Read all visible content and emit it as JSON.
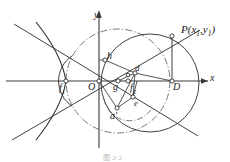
{
  "figure": {
    "kind": "geometry-diagram",
    "width": 230,
    "height": 162,
    "background_color": "#ffffff",
    "stroke_color": "#2b2b2b",
    "axis_color": "#3a3a3a",
    "dashdot_color": "#4a4a4a",
    "caption": "图 2-2"
  },
  "axes": {
    "x_label": "x",
    "y_label": "y",
    "origin_label": "O"
  },
  "points": [
    {
      "id": "f1",
      "label": "f",
      "sub": "1",
      "x": 62,
      "y": 81
    },
    {
      "id": "origin",
      "label": "O",
      "sub": "",
      "x": 99,
      "y": 81
    },
    {
      "id": "g",
      "label": "g",
      "sub": "",
      "x": 118,
      "y": 81
    },
    {
      "id": "f2",
      "label": "f",
      "sub": "2",
      "x": 136,
      "y": 81
    },
    {
      "id": "D",
      "label": "D",
      "sub": "",
      "x": 172,
      "y": 81
    },
    {
      "id": "h",
      "label": "h",
      "sub": "",
      "x": 105,
      "y": 58
    },
    {
      "id": "d",
      "label": "d",
      "sub": "",
      "x": 135,
      "y": 72
    },
    {
      "id": "e",
      "label": "e",
      "sub": "",
      "x": 133,
      "y": 98
    },
    {
      "id": "aprime",
      "label": "a",
      "sub": "",
      "x": 117,
      "y": 110
    },
    {
      "id": "P",
      "label": "P",
      "sub": "",
      "x": 172,
      "y": 36
    }
  ],
  "labels": {
    "y_axis": "y",
    "x_axis": "x",
    "origin": "O",
    "f1": "f",
    "f1_sub": "1",
    "f2": "f",
    "f2_sub": "2",
    "g": "g",
    "h": "h",
    "d": "d",
    "e": "e",
    "a_prime": "a′",
    "D": "D",
    "P_main": "P(x",
    "P_sub1": "1",
    "P_mid": ",y",
    "P_sub2": "1",
    "P_end": ")"
  },
  "curves": {
    "hyperbola_left_branch": "left branch of hyperbola passing near f1",
    "asymptote_upper_left": "line from upper-left through origin region",
    "asymptote_lower_right": "line descending to lower-right",
    "circle_large_dashdot": "large dash-dot circle centered near g",
    "circle_solid_right": "solid circle through P and D region",
    "circle_solid_left": "solid arc left of origin",
    "arc_small_dashdot": "small dash-dot arc near a-prime and e"
  }
}
